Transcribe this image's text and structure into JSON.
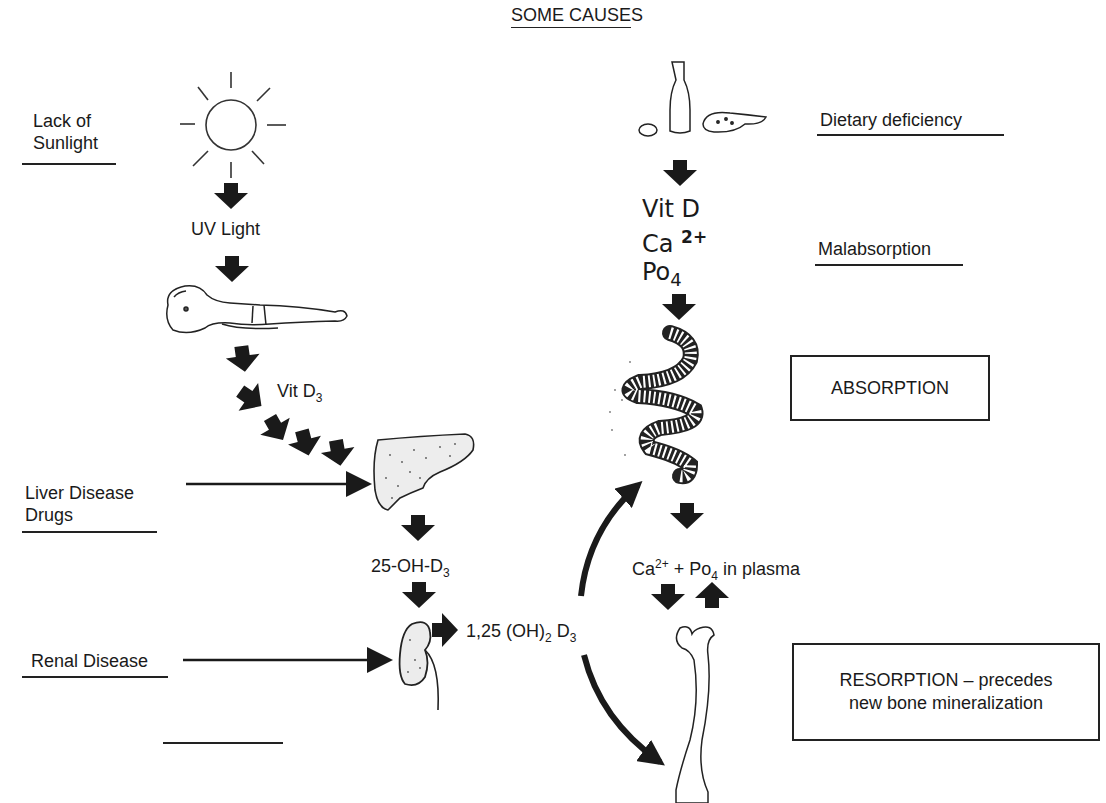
{
  "title": "SOME CAUSES",
  "causes": {
    "lack_of_sunlight": [
      "Lack of",
      "Sunlight"
    ],
    "dietary_deficiency": "Dietary deficiency",
    "malabsorption": "Malabsorption",
    "liver_disease": [
      "Liver Disease",
      "Drugs"
    ],
    "renal_disease": "Renal Disease"
  },
  "pathway": {
    "uv_light": "UV Light",
    "vit_d3": {
      "base": "Vit D",
      "sub": "3"
    },
    "hydroxy_25": {
      "base": "25-OH-D",
      "sub": "3"
    },
    "dihydroxy": {
      "pre": "1,25 (OH)",
      "sub1": "2",
      "mid": " D",
      "sub2": "3"
    },
    "diet_vit_d": "Vit D",
    "diet_ca": {
      "base": "Ca",
      "sup": "2+"
    },
    "diet_po4": {
      "base": "Po",
      "sub": "4"
    },
    "plasma": {
      "ca": "Ca",
      "ca_sup": "2+",
      "plus": " + Po",
      "po_sub": "4",
      "tail": " in plasma"
    }
  },
  "boxes": {
    "absorption": "ABSORPTION",
    "resorption": [
      "RESORPTION – precedes",
      "new bone mineralization"
    ]
  },
  "illustrations": [
    "sun",
    "child-lying",
    "liver",
    "kidney",
    "milk-bottle",
    "egg",
    "fish",
    "intestine",
    "femur-bone"
  ],
  "colors": {
    "ink": "#1a1a1a",
    "background": "#ffffff"
  }
}
